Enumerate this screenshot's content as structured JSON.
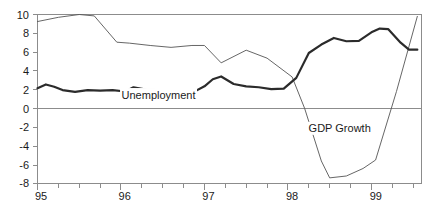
{
  "chart_data": {
    "type": "line",
    "title": "",
    "subtitle": "",
    "xlabel": "",
    "ylabel": "",
    "xlim": [
      95.0,
      99.6
    ],
    "ylim": [
      -8,
      10
    ],
    "yticks": [
      -8,
      -6,
      -4,
      -2,
      0,
      2,
      4,
      6,
      8,
      10
    ],
    "ytick_labels": [
      "-8",
      "-6",
      "-4",
      "-2",
      "0",
      "2",
      "4",
      "6",
      "8",
      "10"
    ],
    "xticks": [
      95,
      96,
      97,
      98,
      99
    ],
    "xtick_labels": [
      "95",
      "96",
      "97",
      "98",
      "99"
    ],
    "x_minor_tick_interval": 0.25,
    "grid": false,
    "legend_position": "inline-annotations",
    "zero_reference_line": 0,
    "annotations": [
      {
        "text": "Unemployment",
        "x": 96.45,
        "y": 1.05
      },
      {
        "text": "GDP Growth",
        "x": 98.62,
        "y": -2.55
      }
    ],
    "series": [
      {
        "name": "Unemployment",
        "style": "thick",
        "color": "#2b2b2b",
        "linewidth": 2.2,
        "x": [
          95.0,
          95.1,
          95.2,
          95.3,
          95.45,
          95.6,
          95.75,
          95.9,
          96.05,
          96.15,
          96.3,
          96.45,
          96.6,
          96.72,
          96.85,
          97.0,
          97.1,
          97.2,
          97.35,
          97.5,
          97.65,
          97.8,
          97.95,
          98.1,
          98.25,
          98.4,
          98.55,
          98.7,
          98.85,
          99.0,
          99.1,
          99.2,
          99.35,
          99.45,
          99.55
        ],
        "y": [
          2.15,
          2.55,
          2.3,
          1.95,
          1.75,
          1.95,
          1.9,
          1.95,
          1.8,
          2.25,
          2.0,
          1.95,
          1.75,
          1.95,
          1.65,
          2.35,
          3.1,
          3.4,
          2.6,
          2.35,
          2.25,
          2.05,
          2.1,
          3.25,
          5.9,
          6.8,
          7.5,
          7.15,
          7.2,
          8.1,
          8.5,
          8.45,
          7.0,
          6.25,
          6.25
        ]
      },
      {
        "name": "GDP Growth",
        "style": "thin",
        "color": "#555555",
        "linewidth": 0.9,
        "x": [
          95.0,
          95.25,
          95.5,
          95.68,
          95.95,
          96.1,
          96.35,
          96.6,
          96.85,
          97.0,
          97.2,
          97.5,
          97.75,
          98.05,
          98.2,
          98.4,
          98.5,
          98.7,
          98.9,
          99.05,
          99.3,
          99.55
        ],
        "y": [
          9.25,
          9.7,
          10.0,
          9.85,
          7.05,
          6.95,
          6.7,
          6.5,
          6.7,
          6.7,
          4.85,
          6.2,
          5.35,
          3.35,
          0.0,
          -5.6,
          -7.4,
          -7.2,
          -6.4,
          -5.5,
          1.8,
          9.8
        ]
      }
    ]
  }
}
